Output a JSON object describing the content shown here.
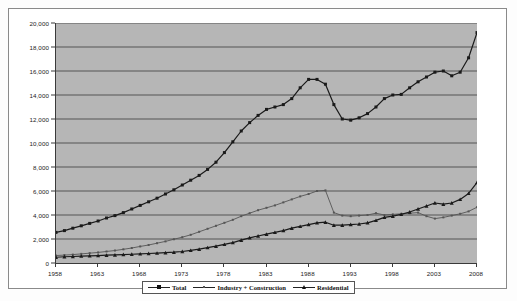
{
  "chart_data": {
    "type": "line",
    "title": "",
    "xlabel": "",
    "ylabel": "",
    "xlim": [
      1958,
      2008
    ],
    "ylim": [
      0,
      20000
    ],
    "grid": true,
    "legend_position": "bottom",
    "y_ticks": [
      "0",
      "2,000",
      "4,000",
      "6,000",
      "8,000",
      "10,000",
      "12,000",
      "14,000",
      "16,000",
      "18,000",
      "20,000"
    ],
    "y_tick_values": [
      0,
      2000,
      4000,
      6000,
      8000,
      10000,
      12000,
      14000,
      16000,
      18000,
      20000
    ],
    "x_ticks": [
      "1958",
      "1963",
      "1968",
      "1973",
      "1978",
      "1983",
      "1988",
      "1993",
      "1998",
      "2003",
      "2008"
    ],
    "x_tick_values": [
      1958,
      1963,
      1968,
      1973,
      1978,
      1983,
      1988,
      1993,
      1998,
      2003,
      2008
    ],
    "x": [
      1958,
      1959,
      1960,
      1961,
      1962,
      1963,
      1964,
      1965,
      1966,
      1967,
      1968,
      1969,
      1970,
      1971,
      1972,
      1973,
      1974,
      1975,
      1976,
      1977,
      1978,
      1979,
      1980,
      1981,
      1982,
      1983,
      1984,
      1985,
      1986,
      1987,
      1988,
      1989,
      1990,
      1991,
      1992,
      1993,
      1994,
      1995,
      1996,
      1997,
      1998,
      1999,
      2000,
      2001,
      2002,
      2003,
      2004,
      2005,
      2006,
      2007,
      2008
    ],
    "series": [
      {
        "name": "Total",
        "marker": "square",
        "color": "#1a1a1a",
        "values": [
          2550,
          2700,
          2900,
          3100,
          3300,
          3500,
          3750,
          3950,
          4200,
          4500,
          4800,
          5100,
          5400,
          5750,
          6100,
          6500,
          6900,
          7300,
          7800,
          8400,
          9200,
          10100,
          11000,
          11700,
          12300,
          12800,
          13000,
          13200,
          13700,
          14600,
          15300,
          15300,
          14900,
          13200,
          12000,
          11900,
          12100,
          12450,
          13000,
          13700,
          14000,
          14050,
          14600,
          15100,
          15500,
          15900,
          16000,
          15600,
          15900,
          17100,
          19200
        ]
      },
      {
        "name": "Industry + Construction",
        "marker": "dot",
        "color": "#555555",
        "values": [
          620,
          660,
          700,
          760,
          820,
          880,
          960,
          1040,
          1140,
          1250,
          1380,
          1500,
          1650,
          1800,
          1980,
          2150,
          2350,
          2600,
          2850,
          3100,
          3350,
          3600,
          3900,
          4150,
          4400,
          4600,
          4800,
          5050,
          5300,
          5550,
          5750,
          6000,
          6050,
          4200,
          3950,
          3900,
          3950,
          4000,
          4150,
          4000,
          4050,
          4100,
          4150,
          4200,
          3900,
          3700,
          3800,
          3950,
          4100,
          4300,
          4650
        ]
      },
      {
        "name": "Residential",
        "marker": "triangle",
        "color": "#1a1a1a",
        "values": [
          480,
          520,
          540,
          570,
          600,
          620,
          650,
          670,
          700,
          730,
          760,
          790,
          820,
          860,
          900,
          960,
          1050,
          1150,
          1280,
          1400,
          1550,
          1700,
          1900,
          2100,
          2250,
          2400,
          2550,
          2700,
          2900,
          3050,
          3200,
          3350,
          3400,
          3150,
          3150,
          3200,
          3250,
          3350,
          3550,
          3800,
          3900,
          4050,
          4250,
          4500,
          4750,
          5000,
          4900,
          5000,
          5300,
          5800,
          6700
        ]
      }
    ]
  },
  "legend": {
    "entries": [
      {
        "label": "Total",
        "marker": "square"
      },
      {
        "label": "Industry + Construction",
        "marker": "dot"
      },
      {
        "label": "Residential",
        "marker": "triangle"
      }
    ]
  },
  "footer": {
    "caption": ""
  }
}
